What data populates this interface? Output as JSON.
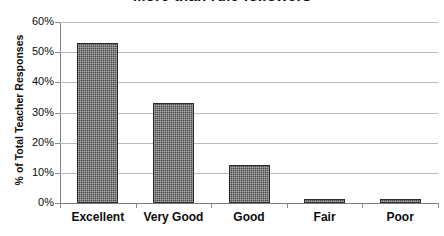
{
  "chart_data": {
    "type": "bar",
    "title": "More than rule followers",
    "xlabel": "",
    "ylabel": "% of Total Teacher Responses",
    "categories": [
      "Excellent",
      "Very Good",
      "Good",
      "Fair",
      "Poor"
    ],
    "values": [
      53,
      33,
      12.5,
      1.3,
      1.3
    ],
    "value_labels": [
      "53%",
      "33%",
      "12.5%",
      "1.3%",
      "1.3%"
    ],
    "ylim": [
      0,
      60
    ],
    "ytick_labels": [
      "0%",
      "10%",
      "20%",
      "30%",
      "40%",
      "50%",
      "60%"
    ],
    "ytick_values": [
      0,
      10,
      20,
      30,
      40,
      50,
      60
    ],
    "grid": "horizontal",
    "legend": "none",
    "series": [
      {
        "name": "% of Total Teacher Responses",
        "values": [
          53,
          33,
          12.5,
          1.3,
          1.3
        ]
      }
    ],
    "colors": {
      "bar_fill": "#4a4a4a",
      "bar_border": "#2b2b2b",
      "gridline": "#b9b9b9",
      "axis": "#808080",
      "text": "#0d0d0d",
      "background": "#ffffff"
    }
  }
}
